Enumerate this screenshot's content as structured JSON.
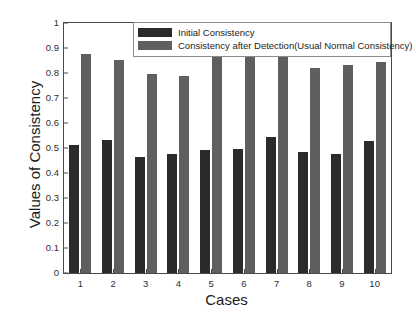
{
  "chart_data": {
    "type": "bar",
    "title": "",
    "xlabel": "Cases",
    "ylabel": "Values of Consistency",
    "categories": [
      "1",
      "2",
      "3",
      "4",
      "5",
      "6",
      "7",
      "8",
      "9",
      "10"
    ],
    "series": [
      {
        "name": "Initial Consistency",
        "color": "#2b2b2b",
        "values": [
          0.513,
          0.533,
          0.463,
          0.476,
          0.494,
          0.498,
          0.544,
          0.486,
          0.476,
          0.528
        ]
      },
      {
        "name": "Consistency after Detection(Usual Normal Consistency)",
        "color": "#5f5f5f",
        "values": [
          0.878,
          0.852,
          0.796,
          0.789,
          0.876,
          0.87,
          0.88,
          0.819,
          0.834,
          0.845
        ]
      }
    ],
    "ylim": [
      0,
      1
    ],
    "yticks": [
      "0",
      "0.1",
      "0.2",
      "0.3",
      "0.4",
      "0.5",
      "0.6",
      "0.7",
      "0.8",
      "0.9",
      "1"
    ],
    "ytick_values": [
      0,
      0.1,
      0.2,
      0.3,
      0.4,
      0.5,
      0.6,
      0.7,
      0.8,
      0.9,
      1
    ],
    "grid": false,
    "legend_position": "top-right"
  },
  "legend": {
    "entries": [
      {
        "label": "Initial Consistency"
      },
      {
        "label": "Consistency after Detection(Usual Normal Consistency)"
      }
    ]
  },
  "axes": {
    "x_title": "Cases",
    "y_title": "Values of Consistency"
  }
}
